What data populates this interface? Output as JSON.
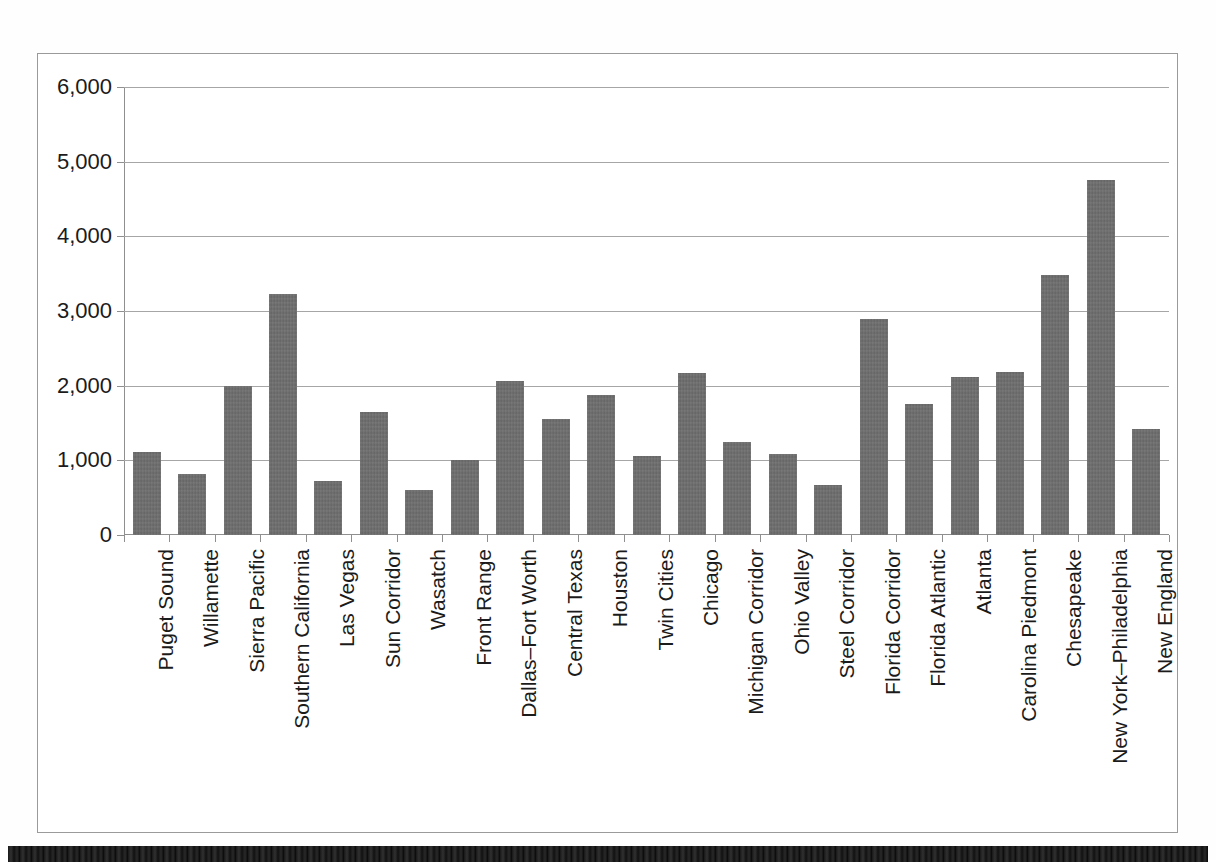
{
  "chart_data": {
    "type": "bar",
    "title": "",
    "xlabel": "",
    "ylabel": "",
    "ylim": [
      0,
      6000
    ],
    "ytick_labels": [
      "0",
      "1,000",
      "2,000",
      "3,000",
      "4,000",
      "5,000",
      "6,000"
    ],
    "ytick_values": [
      0,
      1000,
      2000,
      3000,
      4000,
      5000,
      6000
    ],
    "grid": true,
    "legend": "none",
    "bar_color": "#6d6d6d",
    "gridline_color": "#a6a6a6",
    "axis_color": "#8f8f8f",
    "frame_color": "#9a9a9a",
    "categories": [
      "Puget Sound",
      "Willamette",
      "Sierra Pacific",
      "Southern California",
      "Las Vegas",
      "Sun Corridor",
      "Wasatch",
      "Front Range",
      "Dallas–Fort Worth",
      "Central Texas",
      "Houston",
      "Twin Cities",
      "Chicago",
      "Michigan Corridor",
      "Ohio Valley",
      "Steel Corridor",
      "Florida Corridor",
      "Florida Atlantic",
      "Atlanta",
      "Carolina Piedmont",
      "Chesapeake",
      "New York–Philadelphia",
      "New England"
    ],
    "values": [
      1110,
      820,
      1990,
      3230,
      720,
      1650,
      600,
      1010,
      2060,
      1550,
      1870,
      1060,
      2170,
      1250,
      1090,
      670,
      2890,
      1750,
      2120,
      2180,
      3480,
      4750,
      1420
    ]
  }
}
